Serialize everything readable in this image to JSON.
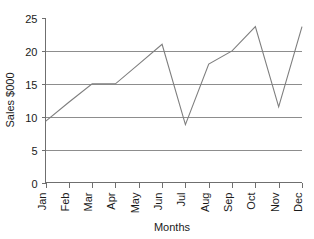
{
  "chart_data": {
    "type": "line",
    "title": "",
    "xlabel": "Months",
    "ylabel": "Sales $000",
    "categories": [
      "Jan",
      "Feb",
      "Mar",
      "Apr",
      "May",
      "Jun",
      "Jul",
      "Aug",
      "Sep",
      "Oct",
      "Nov",
      "Dec"
    ],
    "values": [
      9.3,
      12.2,
      15.0,
      15.0,
      18.0,
      21.0,
      8.8,
      18.0,
      20.0,
      23.7,
      11.5,
      23.7
    ],
    "series": [
      {
        "name": "Sales",
        "values": [
          9.3,
          12.2,
          15.0,
          15.0,
          18.0,
          21.0,
          8.8,
          18.0,
          20.0,
          23.7,
          11.5,
          23.7
        ]
      }
    ],
    "ylim": [
      0,
      25
    ],
    "yticks": [
      0,
      5,
      10,
      15,
      20,
      25
    ],
    "ytick_labels": [
      "0",
      "5",
      "10",
      "15",
      "20",
      "25"
    ],
    "gridlines_y": [
      5,
      10,
      15,
      20
    ],
    "grid": "horizontal",
    "legend": "none",
    "markers": "none",
    "line_color": "#7e7e7e",
    "grid_color": "#8d8d8d",
    "axis_color": "#6f6f6f",
    "text_color": "#1a1a1a",
    "background": "#ffffff",
    "xtick_label_rotation": -90
  },
  "axes": {
    "y_title": "Sales $000",
    "x_title": "Months"
  }
}
